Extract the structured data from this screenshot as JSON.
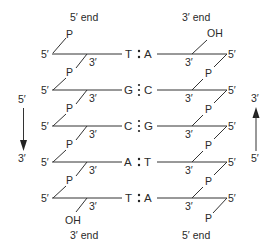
{
  "diagram": {
    "type": "dna-double-strand-antiparallel",
    "top_labels": {
      "left": "5′ end",
      "right": "3′ end"
    },
    "bottom_labels": {
      "left": "3′ end",
      "right": "5′ end"
    },
    "left_arrow": {
      "top": "5′",
      "bottom": "3′",
      "direction": "down"
    },
    "right_arrow": {
      "top": "3′",
      "bottom": "5′",
      "direction": "up"
    },
    "left_strand": {
      "top_terminal": "P",
      "bottom_terminal": "OH",
      "end5_label": "5′",
      "end3_label": "3′",
      "linker": "P"
    },
    "right_strand": {
      "top_terminal": "OH",
      "bottom_terminal": "P",
      "end5_label": "5′",
      "end3_label": "3′",
      "linker": "P"
    },
    "base_pairs": [
      {
        "left": "T",
        "right": "A",
        "bond": ":",
        "h_bonds": 2
      },
      {
        "left": "G",
        "right": "C",
        "bond": "⋮",
        "h_bonds": 3
      },
      {
        "left": "C",
        "right": "G",
        "bond": "⋮",
        "h_bonds": 3
      },
      {
        "left": "A",
        "right": "T",
        "bond": ":",
        "h_bonds": 2
      },
      {
        "left": "T",
        "right": "A",
        "bond": ":",
        "h_bonds": 2
      }
    ]
  }
}
